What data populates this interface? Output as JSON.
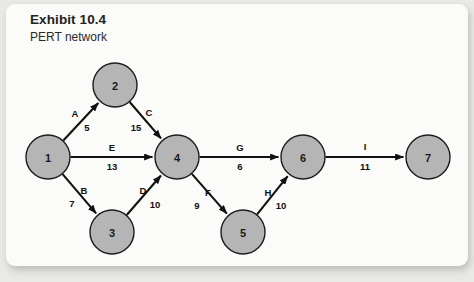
{
  "panel": {
    "title": "Exhibit 10.4",
    "subtitle": "PERT network"
  },
  "chart_data": {
    "type": "diagram",
    "title": "Exhibit 10.4",
    "subtitle": "PERT network",
    "diagram_kind": "PERT network (activity-on-arrow)",
    "node_fill_color": "#b5b5b5",
    "node_stroke_color": "#1d1d1d",
    "edge_color": "#111111",
    "panel_background": "#fbfbfa",
    "page_background": "#e9e9e7",
    "nodes": [
      {
        "id": "1",
        "label": "1",
        "cx": 48,
        "cy": 157,
        "r": 22
      },
      {
        "id": "2",
        "label": "2",
        "cx": 115,
        "cy": 85,
        "r": 22
      },
      {
        "id": "3",
        "label": "3",
        "cx": 112,
        "cy": 232,
        "r": 22
      },
      {
        "id": "4",
        "label": "4",
        "cx": 177,
        "cy": 157,
        "r": 22
      },
      {
        "id": "5",
        "label": "5",
        "cx": 243,
        "cy": 232,
        "r": 22
      },
      {
        "id": "6",
        "label": "6",
        "cx": 303,
        "cy": 157,
        "r": 22
      },
      {
        "id": "7",
        "label": "7",
        "cx": 428,
        "cy": 157,
        "r": 22
      }
    ],
    "edges": [
      {
        "name": "A",
        "duration": "5",
        "from": "1",
        "to": "2",
        "name_x": 75,
        "name_y": 113,
        "duration_x": 87,
        "duration_y": 127
      },
      {
        "name": "C",
        "duration": "15",
        "from": "2",
        "to": "4",
        "name_x": 149,
        "name_y": 112,
        "duration_x": 136,
        "duration_y": 127
      },
      {
        "name": "E",
        "duration": "13",
        "from": "1",
        "to": "4",
        "name_x": 112,
        "name_y": 147,
        "duration_x": 112,
        "duration_y": 166
      },
      {
        "name": "B",
        "duration": "7",
        "from": "1",
        "to": "3",
        "name_x": 84,
        "name_y": 190,
        "duration_x": 72,
        "duration_y": 203
      },
      {
        "name": "D",
        "duration": "10",
        "from": "3",
        "to": "4",
        "name_x": 143,
        "name_y": 190,
        "duration_x": 155,
        "duration_y": 204
      },
      {
        "name": "G",
        "duration": "6",
        "from": "4",
        "to": "6",
        "name_x": 240,
        "name_y": 147,
        "duration_x": 240,
        "duration_y": 166
      },
      {
        "name": "F",
        "duration": "9",
        "from": "4",
        "to": "5",
        "name_x": 208,
        "name_y": 192,
        "duration_x": 197,
        "duration_y": 205
      },
      {
        "name": "H",
        "duration": "10",
        "from": "5",
        "to": "6",
        "name_x": 268,
        "name_y": 192,
        "duration_x": 281,
        "duration_y": 205
      },
      {
        "name": "I",
        "duration": "11",
        "from": "6",
        "to": "7",
        "name_x": 365,
        "name_y": 146,
        "duration_x": 365,
        "duration_y": 166
      }
    ],
    "bleed_text": [
      {
        "text": "the estimated",
        "x": 36,
        "y": 58,
        "size": 12
      },
      {
        "text": "following",
        "x": 36,
        "y": 74,
        "size": 12
      },
      {
        "text": "to make",
        "x": 40,
        "y": 92,
        "size": 11
      },
      {
        "text": "of time",
        "x": 40,
        "y": 108,
        "size": 11
      },
      {
        "text": "Chapter",
        "x": 330,
        "y": 36,
        "size": 13
      },
      {
        "text": "network",
        "x": 355,
        "y": 56,
        "size": 12
      },
      {
        "text": "project",
        "x": 348,
        "y": 76,
        "size": 12
      },
      {
        "text": "of the time",
        "x": 200,
        "y": 168,
        "size": 12
      },
      {
        "text": "Project",
        "x": 218,
        "y": 196,
        "size": 16
      },
      {
        "text": "the activity",
        "x": 60,
        "y": 214,
        "size": 11
      },
      {
        "text": "Planning",
        "x": 236,
        "y": 248,
        "size": 16
      }
    ]
  }
}
